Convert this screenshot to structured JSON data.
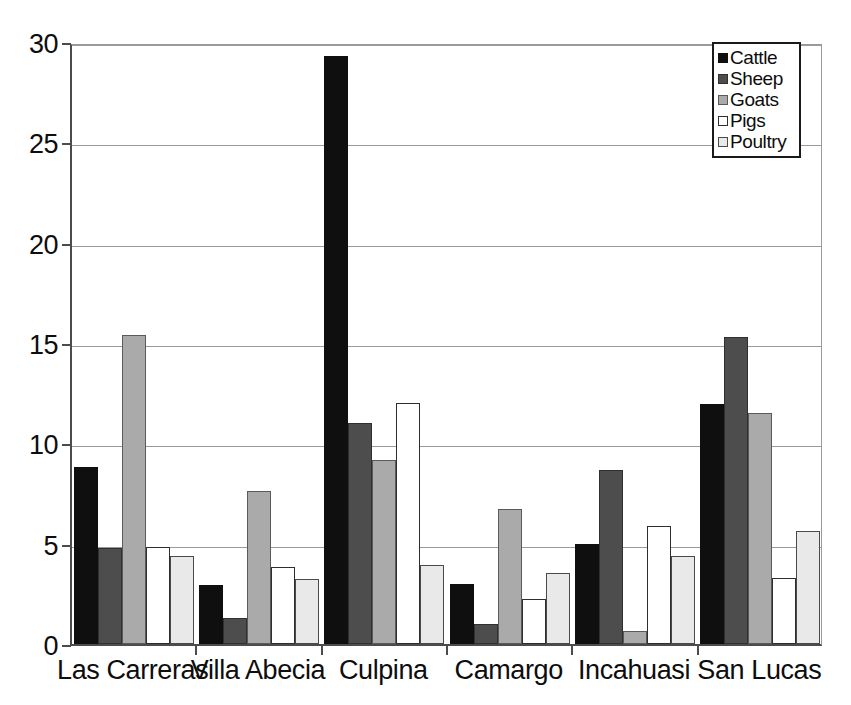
{
  "chart_data": {
    "type": "bar",
    "title": "",
    "subtitle": "",
    "xlabel": "",
    "ylabel": "",
    "ylim": [
      0,
      30
    ],
    "y_ticks": [
      0,
      5,
      10,
      15,
      20,
      25,
      30
    ],
    "y_tick_labels": [
      "0",
      "5",
      "10",
      "15",
      "20",
      "25",
      "30"
    ],
    "grid": true,
    "grid_axis": "y",
    "legend_position": "top-right",
    "grouping": "grouped",
    "categories": [
      "Las Carreras",
      "Villa Abecia",
      "Culpina",
      "Camargo",
      "Incahuasi",
      "San Lucas"
    ],
    "series": [
      {
        "name": "Cattle",
        "color": "#0f0f0f",
        "values": [
          8.8,
          2.95,
          29.3,
          3.0,
          5.0,
          11.95
        ]
      },
      {
        "name": "Sheep",
        "color": "#4d4d4d",
        "values": [
          4.8,
          1.3,
          11.0,
          1.0,
          8.65,
          15.3
        ]
      },
      {
        "name": "Goats",
        "color": "#aaaaaa",
        "values": [
          15.4,
          7.65,
          9.15,
          6.75,
          0.65,
          11.5
        ]
      },
      {
        "name": "Pigs",
        "color": "#ffffff",
        "values": [
          4.85,
          3.85,
          12.0,
          2.25,
          5.9,
          3.3
        ]
      },
      {
        "name": "Poultry",
        "color": "#e9e9e9",
        "values": [
          4.4,
          3.25,
          3.95,
          3.55,
          4.4,
          5.65
        ]
      }
    ]
  },
  "legend": {
    "entries": [
      {
        "label": "Cattle",
        "swatch": "legend-swatch-cattle"
      },
      {
        "label": "Sheep",
        "swatch": "legend-swatch-sheep"
      },
      {
        "label": "Goats",
        "swatch": "legend-swatch-goats"
      },
      {
        "label": "Pigs",
        "swatch": "legend-swatch-pigs"
      },
      {
        "label": "Poultry",
        "swatch": "legend-swatch-poultry"
      }
    ]
  }
}
